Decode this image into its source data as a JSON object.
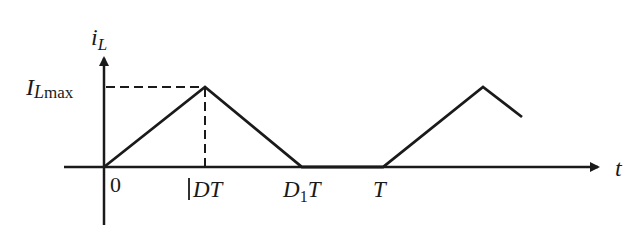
{
  "diagram": {
    "type": "waveform",
    "y_axis_label": "i",
    "y_axis_label_sub": "L",
    "x_axis_label": "t",
    "peak_label_main": "I",
    "peak_label_sub": "L",
    "peak_label_sub2": "max",
    "origin_label": "0",
    "tick_labels": {
      "dt": "DT",
      "d1t_main": "D",
      "d1t_sub": "1",
      "d1t_tail": "T",
      "t": "T"
    },
    "colors": {
      "line": "#1a1a1a",
      "background": "#ffffff"
    }
  }
}
